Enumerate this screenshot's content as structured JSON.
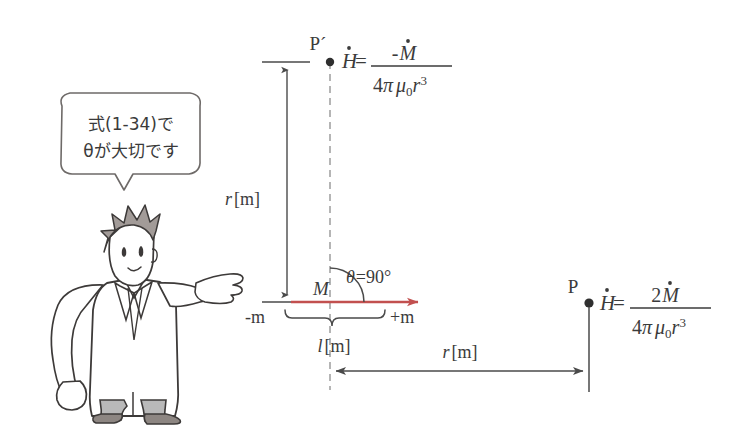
{
  "figure": {
    "background_color": "#ffffff",
    "ink_color": "#3b3b3b",
    "accent_color": "#c2504f",
    "hair_color": "#a29b98",
    "trouser_color": "#b9b9b9",
    "shoe_color": "#8d8682"
  },
  "speech_bubble": {
    "line1": "式(1-34)で",
    "line2": "θが大切です"
  },
  "points": {
    "p_prime_label": "P´",
    "p_label": "P"
  },
  "formulas": {
    "top": {
      "lhs": "H=",
      "numerator": "-M",
      "denominator": "4π μ0r",
      "denominator_exponent": "3",
      "numerator_base": "M",
      "numerator_sign": "-",
      "pi": "π",
      "mu": "μ",
      "mu_sub": "0",
      "r": "r",
      "four": "4",
      "H": "H"
    },
    "right": {
      "lhs": "H=",
      "numerator": "2M",
      "denominator": "4π μ0r",
      "denominator_exponent": "3",
      "numerator_coefficient": "2",
      "numerator_base": "M",
      "pi": "π",
      "mu": "μ",
      "mu_sub": "0",
      "r": "r",
      "four": "4",
      "H": "H"
    }
  },
  "labels": {
    "r_vertical": "r",
    "r_vertical_unit": "[m]",
    "r_horizontal": "r",
    "r_horizontal_unit": "[m]",
    "l_length": "l",
    "l_length_unit": "[m]",
    "moment": "M",
    "pole_negative": "-m",
    "pole_positive": "+m",
    "theta": "θ =90°",
    "theta_symbol": "θ",
    "theta_value": "=90°"
  }
}
